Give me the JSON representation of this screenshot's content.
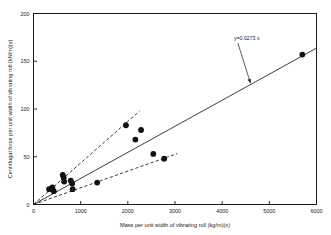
{
  "chart_data": {
    "type": "scatter",
    "title": "",
    "xlabel": "Mass per unit width of vibrating roll (kg/m)(x)",
    "ylabel": "Centrifugal force per unit width of vibrating roll (kN/m)(y)",
    "xlim": [
      0,
      6000
    ],
    "ylim": [
      0,
      200
    ],
    "xticks": [
      0,
      1000,
      2000,
      3000,
      4000,
      5000,
      6000
    ],
    "xtick_labels": [
      "0",
      "1000",
      "2000",
      "3000",
      "4000",
      "5000",
      "6000"
    ],
    "yticks": [
      0,
      50,
      100,
      150,
      200
    ],
    "ytick_labels": [
      "0",
      "50",
      "100",
      "150",
      "200"
    ],
    "grid": false,
    "legend": "none",
    "marker": "filled-circle",
    "marker_color": "#111111",
    "points": [
      {
        "x": 330,
        "y": 16
      },
      {
        "x": 400,
        "y": 18
      },
      {
        "x": 430,
        "y": 14
      },
      {
        "x": 620,
        "y": 31
      },
      {
        "x": 640,
        "y": 28
      },
      {
        "x": 650,
        "y": 24
      },
      {
        "x": 790,
        "y": 25
      },
      {
        "x": 820,
        "y": 22
      },
      {
        "x": 830,
        "y": 16
      },
      {
        "x": 1350,
        "y": 23
      },
      {
        "x": 1960,
        "y": 83
      },
      {
        "x": 2160,
        "y": 68
      },
      {
        "x": 2280,
        "y": 78
      },
      {
        "x": 2540,
        "y": 53
      },
      {
        "x": 2770,
        "y": 48
      },
      {
        "x": 5700,
        "y": 157
      }
    ],
    "fit_lines": [
      {
        "name": "mean-fit-solid",
        "style": "solid",
        "slope": 0.0273,
        "intercept": 0,
        "x_start": 0,
        "x_end": 6000,
        "label": "y=0.0273 x"
      },
      {
        "name": "upper-bound-dashed",
        "style": "dashed",
        "slope": 0.0435,
        "intercept": 0,
        "x_start": 0,
        "x_end": 2250
      },
      {
        "name": "lower-bound-dashed",
        "style": "dashed",
        "slope": 0.0175,
        "intercept": 0,
        "x_start": 0,
        "x_end": 3050
      }
    ],
    "annotations": [
      {
        "name": "equation-annotation",
        "text": "y=0.0273 x",
        "text_x": 4250,
        "text_y": 172,
        "arrow_to_x": 4600,
        "arrow_to_y": 127
      }
    ]
  }
}
